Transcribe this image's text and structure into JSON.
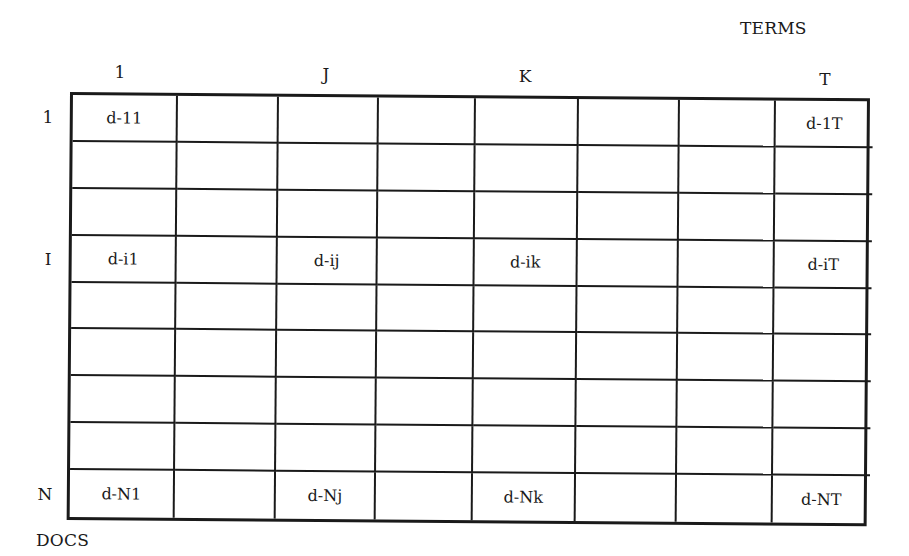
{
  "axis_titles": {
    "terms": "TERMS",
    "docs": "DOCS"
  },
  "column_labels": [
    {
      "label": "1",
      "x": 120,
      "y": 72
    },
    {
      "label": "J",
      "x": 326,
      "y": 74
    },
    {
      "label": "K",
      "x": 525,
      "y": 76
    },
    {
      "label": "T",
      "x": 825,
      "y": 79
    }
  ],
  "row_labels": [
    {
      "label": "1",
      "x": 48,
      "y": 117
    },
    {
      "label": "I",
      "x": 48,
      "y": 259
    },
    {
      "label": "N",
      "x": 45,
      "y": 494
    }
  ],
  "matrix": {
    "columns": 8,
    "rows": 9,
    "cells": [
      [
        "d-11",
        "",
        "",
        "",
        "",
        "",
        "",
        "d-1T"
      ],
      [
        "",
        "",
        "",
        "",
        "",
        "",
        "",
        ""
      ],
      [
        "",
        "",
        "",
        "",
        "",
        "",
        "",
        ""
      ],
      [
        "d-i1",
        "",
        "d-ij",
        "",
        "d-ik",
        "",
        "",
        "d-iT"
      ],
      [
        "",
        "",
        "",
        "",
        "",
        "",
        "",
        ""
      ],
      [
        "",
        "",
        "",
        "",
        "",
        "",
        "",
        ""
      ],
      [
        "",
        "",
        "",
        "",
        "",
        "",
        "",
        ""
      ],
      [
        "",
        "",
        "",
        "",
        "",
        "",
        "",
        ""
      ],
      [
        "d-N1",
        "",
        "d-Nj",
        "",
        "d-Nk",
        "",
        "",
        "d-NT"
      ]
    ]
  }
}
